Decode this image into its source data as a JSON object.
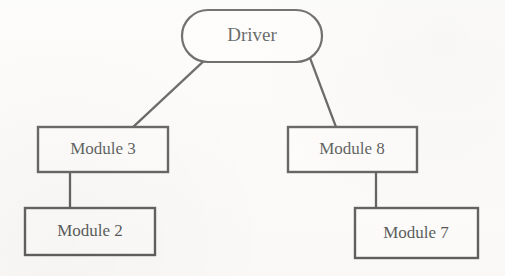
{
  "diagram": {
    "type": "tree",
    "background_color": "#fbfaf8",
    "stroke_color": "#2b2a28",
    "fill_color": "#fdfcfa",
    "text_color": "#211f1e",
    "nodes": [
      {
        "id": "driver",
        "label": "Driver",
        "shape": "stadium",
        "x": 182,
        "y": 10,
        "width": 140,
        "height": 52,
        "center_x": 252,
        "center_y": 36,
        "font_size": 19,
        "stroke_width": 2.2
      },
      {
        "id": "module3",
        "label": "Module 3",
        "shape": "rectangle",
        "x": 38,
        "y": 127,
        "width": 130,
        "height": 45,
        "center_x": 103,
        "center_y": 149,
        "font_size": 17,
        "stroke_width": 2.4
      },
      {
        "id": "module8",
        "label": "Module 8",
        "shape": "rectangle",
        "x": 288,
        "y": 127,
        "width": 129,
        "height": 45,
        "center_x": 352,
        "center_y": 149,
        "font_size": 17,
        "stroke_width": 2.4
      },
      {
        "id": "module2",
        "label": "Module 2",
        "shape": "rectangle",
        "x": 25,
        "y": 208,
        "width": 130,
        "height": 47,
        "center_x": 90,
        "center_y": 231,
        "font_size": 17,
        "stroke_width": 2.4
      },
      {
        "id": "module7",
        "label": "Module 7",
        "shape": "rectangle",
        "x": 355,
        "y": 208,
        "width": 123,
        "height": 50,
        "center_x": 416,
        "center_y": 233,
        "font_size": 17,
        "stroke_width": 2.4
      }
    ],
    "edges": [
      {
        "id": "driver-module3",
        "from": "driver",
        "to": "module3",
        "kind": "diagonal",
        "points": "205,60 133,127",
        "stroke_width": 2.3
      },
      {
        "id": "driver-module8",
        "from": "driver",
        "to": "module8",
        "kind": "diagonal",
        "points": "310,58 336,127",
        "stroke_width": 2.3
      },
      {
        "id": "module3-module2",
        "from": "module3",
        "to": "module2",
        "kind": "vertical",
        "points": "70,172 70,208",
        "stroke_width": 2.3
      },
      {
        "id": "module8-module7",
        "from": "module8",
        "to": "module7",
        "kind": "vertical",
        "points": "376,172 376,208",
        "stroke_width": 2.3
      }
    ]
  }
}
